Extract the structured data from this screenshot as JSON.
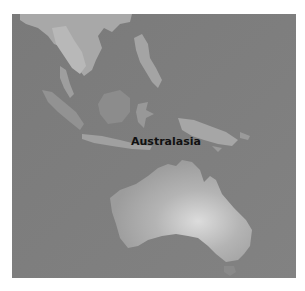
{
  "map": {
    "region_label": "Australasia",
    "style": "grayscale satellite imagery",
    "colors": {
      "ocean": "#7d7d7d",
      "land_light": "#bdbdbd",
      "land_mid": "#a6a6a6",
      "land_dark": "#8e8e8e",
      "label": "#111111"
    }
  }
}
